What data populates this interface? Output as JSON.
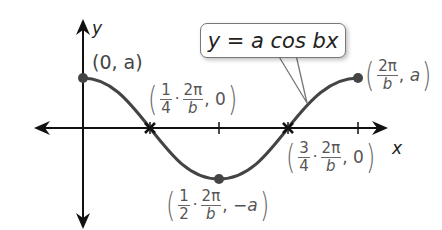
{
  "diagram": {
    "equation": "y = a cos bx",
    "axes": {
      "x_label": "x",
      "y_label": "y"
    },
    "colors": {
      "curve": "#444444",
      "axis": "#111111",
      "label": "#555555",
      "callout_border": "#777777"
    },
    "key_points": [
      {
        "name": "start-maximum",
        "label": "(0, a)",
        "x": "0",
        "y": "a"
      },
      {
        "name": "first-zero",
        "label": "(1/4 · 2π/b, 0)",
        "coef_num": "1",
        "coef_den": "4",
        "period_num": "2π",
        "period_den": "b",
        "y": "0"
      },
      {
        "name": "minimum",
        "label": "(1/2 · 2π/b, −a)",
        "coef_num": "1",
        "coef_den": "2",
        "period_num": "2π",
        "period_den": "b",
        "y": "−a"
      },
      {
        "name": "second-zero",
        "label": "(3/4 · 2π/b, 0)",
        "coef_num": "3",
        "coef_den": "4",
        "period_num": "2π",
        "period_den": "b",
        "y": "0"
      },
      {
        "name": "end-maximum",
        "label": "(2π/b, a)",
        "period_num": "2π",
        "period_den": "b",
        "y": "a"
      }
    ],
    "punct": {
      "open": "(",
      "close": ")",
      "comma": ",",
      "dot": "·",
      "zero": "0",
      "a": "a",
      "neg_a": "−a",
      "start": "(0, a)"
    }
  }
}
